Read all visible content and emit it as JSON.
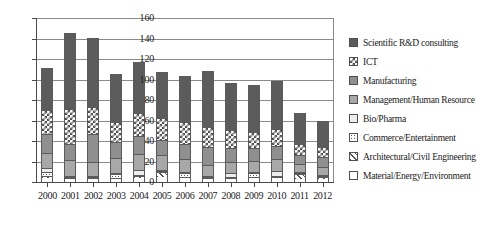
{
  "chart_data": {
    "type": "bar",
    "stacked": true,
    "title": "",
    "xlabel": "",
    "ylabel": "",
    "ylim": [
      0,
      160
    ],
    "ytick_step": 20,
    "yticks": [
      0,
      20,
      40,
      60,
      80,
      100,
      120,
      140,
      160
    ],
    "grid": true,
    "legend_position": "right",
    "categories": [
      "2000",
      "2001",
      "2002",
      "2003",
      "2004",
      "2005",
      "2006",
      "2007",
      "2008",
      "2009",
      "2010",
      "2011",
      "2012"
    ],
    "series": [
      {
        "name": "Material/Energy/Environment",
        "pattern": "white",
        "color": "#ffffff",
        "values": [
          4,
          3,
          3,
          3,
          4,
          5,
          4,
          3,
          3,
          4,
          4,
          3,
          3
        ]
      },
      {
        "name": "Architectural/Civil Engineering",
        "pattern": "diagonal-hatch",
        "color": "#ffffff",
        "values": [
          2,
          1,
          1,
          1,
          2,
          5,
          1,
          1,
          1,
          1,
          1,
          5,
          2
        ]
      },
      {
        "name": "Commerce/Entertainment",
        "pattern": "dots",
        "color": "#ffffff",
        "values": [
          4,
          1,
          1,
          4,
          1,
          1,
          4,
          1,
          1,
          4,
          1,
          1,
          1
        ]
      },
      {
        "name": "Bio/Pharma",
        "pattern": "light",
        "color": "#ededed",
        "values": [
          4,
          1,
          1,
          1,
          5,
          1,
          1,
          1,
          4,
          1,
          5,
          1,
          1
        ]
      },
      {
        "name": "Management/Human Resource",
        "pattern": "solid-light-gray",
        "color": "#a8a8a8",
        "values": [
          14,
          16,
          14,
          14,
          15,
          14,
          12,
          11,
          11,
          11,
          11,
          8,
          8
        ]
      },
      {
        "name": "Manufacturing",
        "pattern": "solid-mid-gray",
        "color": "#8f8f8f",
        "values": [
          19,
          15,
          27,
          16,
          18,
          15,
          15,
          17,
          13,
          12,
          13,
          8,
          9
        ]
      },
      {
        "name": "ICT",
        "pattern": "checkered",
        "color": "#ffffff",
        "values": [
          23,
          34,
          26,
          20,
          22,
          21,
          22,
          20,
          18,
          16,
          17,
          11,
          10
        ]
      },
      {
        "name": "Scientific R&D consulting",
        "pattern": "solid-dark-gray",
        "color": "#5c5c5c",
        "values": [
          41,
          74,
          68,
          46,
          50,
          45,
          44,
          54,
          46,
          46,
          47,
          30,
          26
        ]
      }
    ],
    "totals": [
      111,
      145,
      141,
      105,
      117,
      107,
      103,
      108,
      97,
      95,
      99,
      67,
      60
    ]
  },
  "legend": {
    "items": [
      {
        "label": "Scientific R&D consulting",
        "swatch": "solid-dark-gray"
      },
      {
        "label": "ICT",
        "swatch": "checkered"
      },
      {
        "label": "Manufacturing",
        "swatch": "solid-mid-gray"
      },
      {
        "label": "Management/Human Resource",
        "swatch": "solid-light-gray"
      },
      {
        "label": "Bio/Pharma",
        "swatch": "light"
      },
      {
        "label": "Commerce/Entertainment",
        "swatch": "dots"
      },
      {
        "label": "Architectural/Civil Engineering",
        "swatch": "diagonal-hatch"
      },
      {
        "label": "Material/Energy/Environment",
        "swatch": "white"
      }
    ]
  }
}
